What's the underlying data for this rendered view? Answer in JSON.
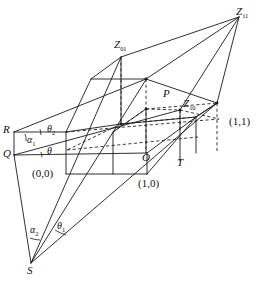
{
  "figure": {
    "type": "line-diagram",
    "width": 269,
    "height": 281,
    "background_color": "#ffffff",
    "line_color": "#1a1a1a"
  },
  "points": [
    {
      "id": "Z11",
      "label": "Z",
      "subscript": "11",
      "x": 239,
      "y": 14,
      "kind": "labeled-vertex"
    },
    {
      "id": "Z01",
      "label": "Z",
      "subscript": "01",
      "x": 121,
      "y": 47,
      "kind": "labeled-vertex"
    },
    {
      "id": "Z10",
      "label": "Z",
      "subscript": "10",
      "x": 181,
      "y": 106,
      "kind": "labeled-vertex"
    },
    {
      "id": "P",
      "label": "P",
      "subscript": "",
      "x": 166,
      "y": 96,
      "kind": "labeled-vertex"
    },
    {
      "id": "R",
      "label": "R",
      "subscript": "",
      "x": 7,
      "y": 131,
      "kind": "labeled-vertex"
    },
    {
      "id": "Q",
      "label": "Q",
      "subscript": "",
      "x": 7,
      "y": 154,
      "kind": "labeled-vertex"
    },
    {
      "id": "O",
      "label": "O",
      "subscript": "",
      "x": 146,
      "y": 156,
      "kind": "labeled-vertex"
    },
    {
      "id": "T",
      "label": "T",
      "subscript": "",
      "x": 180,
      "y": 160,
      "kind": "labeled-vertex"
    },
    {
      "id": "S",
      "label": "S",
      "subscript": "",
      "x": 31,
      "y": 268,
      "kind": "labeled-vertex"
    }
  ],
  "coordinate_labels": [
    {
      "id": "c00",
      "text": "(0,0)",
      "x": 36,
      "y": 174
    },
    {
      "id": "c10",
      "text": "(1,0)",
      "x": 142,
      "y": 184
    },
    {
      "id": "c11",
      "text": "(1,1)",
      "x": 232,
      "y": 122
    }
  ],
  "angle_labels": [
    {
      "id": "theta2",
      "label": "θ",
      "subscript": "2",
      "x": 50,
      "y": 130,
      "at_vertex": "R"
    },
    {
      "id": "alpha1",
      "label": "α",
      "subscript": "1",
      "x": 30,
      "y": 141,
      "at_vertex": "R"
    },
    {
      "id": "theta",
      "label": "θ",
      "subscript": "",
      "x": 50,
      "y": 150,
      "at_vertex": "Q"
    },
    {
      "id": "alpha2",
      "label": "α",
      "subscript": "2",
      "x": 33,
      "y": 230,
      "at_vertex": "S"
    },
    {
      "id": "theta1",
      "label": "θ",
      "subscript": "1",
      "x": 59,
      "y": 227,
      "at_vertex": "S"
    }
  ],
  "solid_paths": [
    "M 239 16 L 217 102",
    "M 239 16 L 146 78",
    "M 239 16 L 180 109",
    "M 239 16 L 217 102 L 196 116",
    "M 146 78 L 121 57",
    "M 146 78 L 217 102",
    "M 121 57 L 121 123",
    "M 121 57 L 91 78",
    "M 91 78 L 146 78",
    "M 91 78 L 66 131",
    "M 66 131 L 121 123",
    "M 121 123 L 196 116",
    "M 196 116 L 217 102",
    "M 14 131 L 66 131",
    "M 14 131 L 14 154",
    "M 14 154 L 146 152",
    "M 14 131 L 146 78",
    "M 14 154 L 180 109",
    "M 146 152 L 196 116",
    "M 66 131 L 66 173",
    "M 66 173 L 146 173",
    "M 146 173 L 146 152",
    "M 146 173 L 196 116",
    "M 113 131 L 113 173",
    "M 113 131 L 146 108",
    "M 146 108 L 146 152",
    "M 31 262 L 14 154",
    "M 31 262 L 121 57",
    "M 31 262 L 146 78",
    "M 31 262 L 217 102",
    "M 196 116 L 217 102",
    "M 146 108 L 180 109",
    "M 180 109 L 180 160",
    "M 196 116 L 196 152"
  ],
  "dashed_paths": [
    "M 121 57 L 121 123",
    "M 146 78 L 146 152",
    "M 217 102 L 217 152",
    "M 66 131 L 217 118",
    "M 66 148 L 196 135",
    "M 113 131 L 146 108",
    "M 121 123 L 66 148",
    "M 146 108 L 217 102"
  ],
  "vertex_dots": [
    {
      "x": 146,
      "y": 78
    },
    {
      "x": 217,
      "y": 102
    },
    {
      "x": 180,
      "y": 109
    },
    {
      "x": 121,
      "y": 123
    },
    {
      "x": 146,
      "y": 108
    }
  ]
}
